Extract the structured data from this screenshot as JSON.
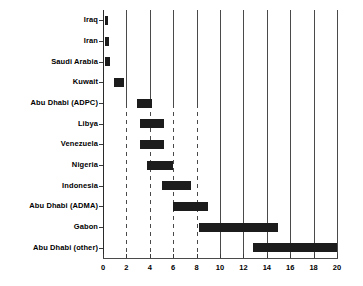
{
  "chart_data": {
    "type": "bar",
    "orientation": "horizontal",
    "subtype": "range-bar",
    "title": "",
    "subtitle": "",
    "xlabel": "",
    "ylabel": "",
    "xlim": [
      0,
      20
    ],
    "ylim": null,
    "grid": true,
    "grid_axis": "x",
    "legend": null,
    "legend_position": "none",
    "bar_color": "#1c1c1c",
    "categories": [
      "Iraq",
      "Iran",
      "Saudi Arabia",
      "Kuwait",
      "Abu Dhabi (ADPC)",
      "Libya",
      "Venezuela",
      "Nigeria",
      "Indonesia",
      "Abu Dhabi (ADMA)",
      "Gabon",
      "Abu Dhabi (other)"
    ],
    "ranges": [
      {
        "category": "Iraq",
        "start": 0.15,
        "end": 0.45
      },
      {
        "category": "Iran",
        "start": 0.2,
        "end": 0.5
      },
      {
        "category": "Saudi Arabia",
        "start": 0.2,
        "end": 0.6
      },
      {
        "category": "Kuwait",
        "start": 0.9,
        "end": 1.8
      },
      {
        "category": "Abu Dhabi (ADPC)",
        "start": 2.9,
        "end": 4.2
      },
      {
        "category": "Libya",
        "start": 3.2,
        "end": 5.2
      },
      {
        "category": "Venezuela",
        "start": 3.2,
        "end": 5.2
      },
      {
        "category": "Nigeria",
        "start": 3.8,
        "end": 6.0
      },
      {
        "category": "Indonesia",
        "start": 5.0,
        "end": 7.5
      },
      {
        "category": "Abu Dhabi (ADMA)",
        "start": 6.0,
        "end": 9.0
      },
      {
        "category": "Gabon",
        "start": 8.2,
        "end": 15.0
      },
      {
        "category": "Abu Dhabi (other)",
        "start": 12.8,
        "end": 20.0
      }
    ],
    "xticks": [
      0,
      2,
      4,
      6,
      8,
      10,
      12,
      14,
      16,
      18,
      20
    ],
    "xtick_labels": [
      "0",
      "2",
      "4",
      "6",
      "8",
      "10",
      "12",
      "14",
      "16",
      "18",
      "20"
    ],
    "gridlines": [
      {
        "value": 2,
        "style": "mixed"
      },
      {
        "value": 4,
        "style": "mixed"
      },
      {
        "value": 6,
        "style": "mixed"
      },
      {
        "value": 8,
        "style": "mixed"
      },
      {
        "value": 10,
        "style": "solid"
      },
      {
        "value": 12,
        "style": "solid"
      },
      {
        "value": 14,
        "style": "solid"
      },
      {
        "value": 16,
        "style": "solid"
      },
      {
        "value": 18,
        "style": "solid"
      },
      {
        "value": 20,
        "style": "solid"
      }
    ]
  },
  "geometry": {
    "plot_left": 103,
    "plot_right": 337,
    "plot_top": 10,
    "plot_bottom": 258,
    "bar_height": 9
  }
}
